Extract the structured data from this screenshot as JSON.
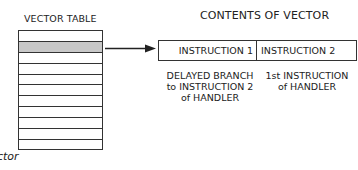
{
  "diagram": {
    "vector_table": {
      "title": "VECTOR TABLE",
      "row_count": 11,
      "highlighted_row_index": 1,
      "highlight_color": "#c8c8c8"
    },
    "contents": {
      "title": "CONTENTS OF VECTOR",
      "cells": [
        {
          "label": "INSTRUCTION 1",
          "note": [
            "DELAYED BRANCH",
            "to INSTRUCTION 2",
            "of HANDLER"
          ]
        },
        {
          "label": "INSTRUCTION 2",
          "note": [
            "1st INSTRUCTION",
            "of HANDLER"
          ]
        }
      ]
    },
    "caption_fragment": "ctor"
  }
}
